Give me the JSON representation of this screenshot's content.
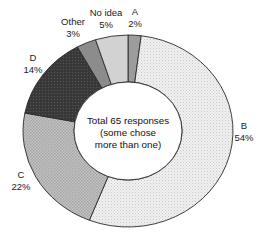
{
  "chart_data": {
    "type": "pie",
    "variant": "donut",
    "title": "",
    "center_label": [
      "Total 65 responses",
      "(some chose",
      "more than one)"
    ],
    "total_responses": 65,
    "start_angle_deg": 0,
    "direction": "clockwise",
    "categories": [
      "A",
      "B",
      "C",
      "D",
      "Other",
      "No idea"
    ],
    "values": [
      2,
      54,
      22,
      14,
      3,
      5
    ],
    "unit": "%",
    "slices": [
      {
        "label": "A",
        "value": 2,
        "value_label": "2%",
        "color": "#9c9c9c",
        "pattern": "none",
        "label_x": 135,
        "label_y": 15,
        "pct_y": 27
      },
      {
        "label": "B",
        "value": 54,
        "value_label": "54%",
        "color": "#ededed",
        "pattern": "fine-dots",
        "label_x": 244,
        "label_y": 129,
        "pct_y": 141
      },
      {
        "label": "C",
        "value": 22,
        "value_label": "22%",
        "color": "#b8b8b8",
        "pattern": "checker",
        "label_x": 21,
        "label_y": 178,
        "pct_y": 190
      },
      {
        "label": "D",
        "value": 14,
        "value_label": "14%",
        "color": "#3c3c3c",
        "pattern": "dark-dots",
        "label_x": 33,
        "label_y": 61,
        "pct_y": 73
      },
      {
        "label": "Other",
        "value": 3,
        "value_label": "3%",
        "color": "#8c8c8c",
        "pattern": "none",
        "label_x": 73,
        "label_y": 25,
        "pct_y": 37
      },
      {
        "label": "No idea",
        "value": 5,
        "value_label": "5%",
        "color": "#d2d2d2",
        "pattern": "none",
        "label_x": 106,
        "label_y": 16,
        "pct_y": 28
      }
    ],
    "geometry": {
      "cx": 128,
      "cy": 131,
      "outer_rx": 105,
      "outer_ry": 96,
      "inner_rx": 54,
      "inner_ry": 49
    },
    "legend": "none (direct labels)",
    "grid": false
  }
}
